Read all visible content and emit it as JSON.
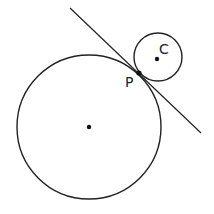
{
  "diagram": {
    "colors": {
      "background": "#ffffff",
      "stroke": "#222222"
    },
    "large_circle": {
      "cx": 89,
      "cy": 127,
      "r": 72,
      "center_label": ""
    },
    "small_circle": {
      "cx": 158,
      "cy": 57,
      "r": 24,
      "center_label": "C"
    },
    "tangent_line": {
      "x1": 70,
      "y1": 8,
      "x2": 201,
      "y2": 133
    },
    "point_p": {
      "x": 139,
      "y": 73,
      "label": "P"
    },
    "labels": {
      "p": "P",
      "c": "C"
    }
  }
}
